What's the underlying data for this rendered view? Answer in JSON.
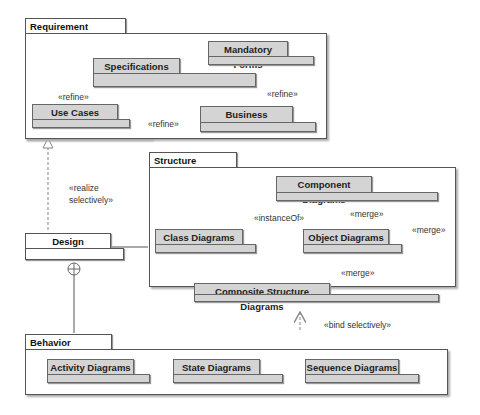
{
  "diagram": {
    "type": "uml-package-diagram",
    "packages": {
      "requirement_analysis": {
        "title": "Requirement Analysis",
        "children": {
          "mandatory_forms": "Mandatory Forms",
          "specifications": "Specifications",
          "use_cases": "Use Cases",
          "business_processes": "Business Processes"
        }
      },
      "design": {
        "title": "Design"
      },
      "structure": {
        "title": "Structure",
        "children": {
          "component_diagrams": "Component Diagrams",
          "class_diagrams": "Class Diagrams",
          "object_diagrams": "Object Diagrams",
          "composite_structure_diagrams": "Composite Structure Diagrams"
        }
      },
      "behavior": {
        "title": "Behavior",
        "children": {
          "activity_diagrams": "Activity Diagrams",
          "state_diagrams": "State Diagrams",
          "sequence_diagrams": "Sequence Diagrams"
        }
      }
    },
    "relationships": {
      "usecases_to_specs": "«refine»",
      "business_to_specs": "«refine»",
      "business_to_usecases": "«refine»",
      "design_realize_line1": "«realize",
      "design_realize_line2": "selectively»",
      "object_instanceof_class": "«instanceOf»",
      "component_merge_object": "«merge»",
      "component_composite_merge": "«merge»",
      "composite_merge_object": "«merge»",
      "behavior_bind_structure": "«bind selectively»"
    },
    "colors": {
      "package_fill": "#d4d4d4",
      "frame_border": "#555555",
      "background": "#ffffff",
      "arrow": "#888888"
    }
  }
}
